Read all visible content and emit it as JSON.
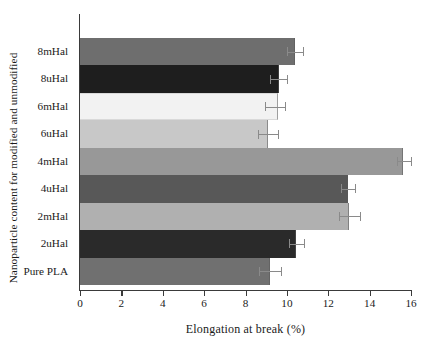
{
  "chart_data": {
    "type": "bar",
    "orientation": "horizontal",
    "title": "",
    "xlabel": "Elongation at break (%)",
    "ylabel": "Nanoparticle content for modified and unmodified",
    "xlim": [
      0,
      16
    ],
    "xticks": [
      0,
      2,
      4,
      6,
      8,
      10,
      12,
      14,
      16
    ],
    "grid": false,
    "legend": null,
    "categories": [
      "8mHal",
      "8uHal",
      "6mHal",
      "6uHal",
      "4mHal",
      "4uHal",
      "2mHal",
      "2uHal",
      "Pure PLA"
    ],
    "values": [
      10.4,
      9.6,
      9.55,
      9.1,
      15.6,
      12.95,
      13.0,
      10.45,
      9.2
    ],
    "errors_low": [
      10.0,
      9.2,
      8.95,
      8.6,
      15.3,
      12.6,
      12.5,
      10.1,
      8.65
    ],
    "errors_high": [
      10.8,
      10.0,
      9.9,
      9.55,
      16.0,
      13.3,
      13.55,
      10.85,
      9.7
    ],
    "bar_colors": [
      "#6e6e6e",
      "#1e1e1e",
      "#f2f2f2",
      "#c8c8c8",
      "#989898",
      "#585858",
      "#b0b0b0",
      "#2a2a2a",
      "#707070"
    ],
    "series": [
      {
        "name": "Elongation at break (%)",
        "points": [
          {
            "category": "8mHal",
            "value": 10.4,
            "err_low": 10.0,
            "err_high": 10.8,
            "color": "#6e6e6e"
          },
          {
            "category": "8uHal",
            "value": 9.6,
            "err_low": 9.2,
            "err_high": 10.0,
            "color": "#1e1e1e"
          },
          {
            "category": "6mHal",
            "value": 9.55,
            "err_low": 8.95,
            "err_high": 9.9,
            "color": "#f2f2f2"
          },
          {
            "category": "6uHal",
            "value": 9.1,
            "err_low": 8.6,
            "err_high": 9.55,
            "color": "#c8c8c8"
          },
          {
            "category": "4mHal",
            "value": 15.6,
            "err_low": 15.3,
            "err_high": 16.0,
            "color": "#989898"
          },
          {
            "category": "4uHal",
            "value": 12.95,
            "err_low": 12.6,
            "err_high": 13.3,
            "color": "#585858"
          },
          {
            "category": "2mHal",
            "value": 13.0,
            "err_low": 12.5,
            "err_high": 13.55,
            "color": "#b0b0b0"
          },
          {
            "category": "2uHal",
            "value": 10.45,
            "err_low": 10.1,
            "err_high": 10.85,
            "color": "#2a2a2a"
          },
          {
            "category": "Pure PLA",
            "value": 9.2,
            "err_low": 8.65,
            "err_high": 9.7,
            "color": "#707070"
          }
        ]
      }
    ]
  },
  "axes": {
    "x_tick_labels": [
      "0",
      "2",
      "4",
      "6",
      "8",
      "10",
      "12",
      "14",
      "16"
    ],
    "y_tick_labels": [
      "8mHal",
      "8uHal",
      "6mHal",
      "6uHal",
      "4mHal",
      "4uHal",
      "2mHal",
      "2uHal",
      "Pure PLA"
    ],
    "x_title": "Elongation at break (%)",
    "y_title": "Nanoparticle content for modified and unmodified"
  }
}
